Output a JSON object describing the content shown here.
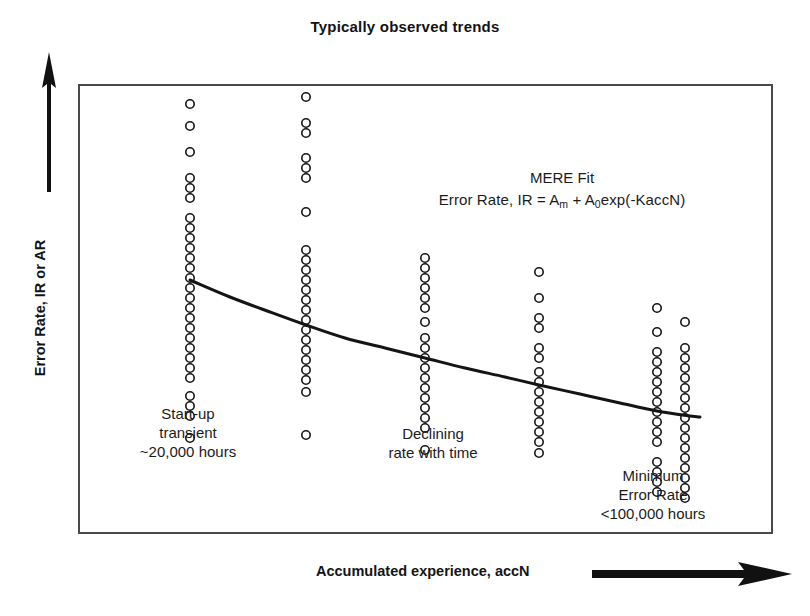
{
  "chart_title": "Typically observed trends",
  "axes": {
    "y_label": "Error Rate, IR or AR",
    "x_label": "Accumulated experience, accN",
    "y_arrow_icon": "up-arrow-icon",
    "x_arrow_icon": "right-arrow-icon"
  },
  "fit": {
    "title": "MERE Fit",
    "equation_prefix": "Error Rate, IR = A",
    "equation_sub1": "m",
    "equation_mid": " + A",
    "equation_sub2": "0",
    "equation_suffix": "exp(-KaccN)"
  },
  "annotations": {
    "startup": {
      "line1": "Start-up",
      "line2": "transient",
      "line3": "~20,000 hours"
    },
    "declining": {
      "line1": "Declining",
      "line2": "rate with time"
    },
    "minimum": {
      "line1": "Minimum",
      "line2": "Error Rate",
      "line3": "<100,000 hours"
    }
  },
  "style": {
    "frame_color": "#4a4a4a",
    "curve_color": "#141414",
    "marker_color": "#141414",
    "text_color": "#1a1a1a",
    "background": "#ffffff"
  },
  "chart_data": {
    "type": "scatter",
    "title": "Typically observed trends",
    "xlabel": "Accumulated experience, accN",
    "ylabel": "Error Rate, IR or AR",
    "grid": false,
    "legend": null,
    "axis_ticks": "none (qualitative axes, arrows indicate direction)",
    "xlim": [
      78,
      773
    ],
    "ylim": [
      84,
      534
    ],
    "marker": {
      "shape": "open-circle",
      "radius_px": 4.2,
      "stroke_px": 1.6
    },
    "series": [
      {
        "name": "Observed error rates",
        "clusters": [
          {
            "x_px": 190,
            "label": "cluster-1",
            "y_px": [
              104,
              126,
              152,
              178,
              188,
              198,
              218,
              228,
              238,
              248,
              258,
              268,
              278,
              288,
              298,
              308,
              318,
              328,
              338,
              348,
              358,
              368,
              378,
              396,
              406,
              416,
              438
            ]
          },
          {
            "x_px": 306,
            "label": "cluster-2",
            "y_px": [
              97,
              123,
              133,
              158,
              168,
              178,
              212,
              250,
              260,
              270,
              280,
              290,
              300,
              310,
              320,
              330,
              340,
              350,
              360,
              370,
              380,
              392,
              435
            ]
          },
          {
            "x_px": 425,
            "label": "cluster-3",
            "y_px": [
              258,
              268,
              278,
              288,
              298,
              308,
              322,
              338,
              348,
              358,
              368,
              378,
              388,
              398,
              408,
              418,
              428,
              450
            ]
          },
          {
            "x_px": 539,
            "label": "cluster-4",
            "y_px": [
              272,
              298,
              318,
              328,
              348,
              358,
              372,
              382,
              392,
              402,
              412,
              422,
              432,
              442,
              453
            ]
          },
          {
            "x_px": 657,
            "label": "cluster-5",
            "y_px": [
              308,
              332,
              352,
              362,
              372,
              382,
              392,
              402,
              412,
              422,
              432,
              442,
              462,
              472,
              482,
              492
            ]
          },
          {
            "x_px": 685,
            "label": "cluster-6",
            "y_px": [
              322,
              348,
              358,
              368,
              378,
              388,
              398,
              408,
              418,
              428,
              438,
              448,
              458,
              468,
              478,
              488,
              498
            ]
          }
        ]
      }
    ],
    "fit_curve": {
      "name": "MERE Fit",
      "equation": "IR = A_m + A_0 exp(-K accN)",
      "points_px": [
        [
          190,
          280
        ],
        [
          230,
          297
        ],
        [
          270,
          312
        ],
        [
          306,
          325
        ],
        [
          345,
          338
        ],
        [
          385,
          348
        ],
        [
          425,
          358
        ],
        [
          465,
          368
        ],
        [
          505,
          377
        ],
        [
          539,
          385
        ],
        [
          580,
          394
        ],
        [
          620,
          403
        ],
        [
          657,
          411
        ],
        [
          690,
          416
        ],
        [
          700,
          417
        ]
      ]
    }
  }
}
